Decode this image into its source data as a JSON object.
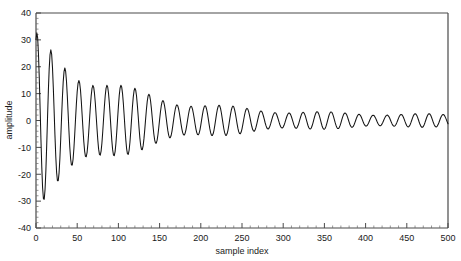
{
  "chart_data": {
    "type": "line",
    "title": "",
    "xlabel": "sample  index",
    "ylabel": "amplitude",
    "xlim": [
      0,
      500
    ],
    "ylim": [
      -40,
      40
    ],
    "grid": false,
    "legend": null,
    "line_color": "#141414",
    "background_color": "#ffffff",
    "axis_color": "#4a4a4a",
    "x_ticks": [
      0,
      50,
      100,
      150,
      200,
      250,
      300,
      350,
      400,
      450,
      500
    ],
    "x_tick_labels": [
      "0",
      "50",
      "100",
      "150",
      "200",
      "250",
      "300",
      "350",
      "400",
      "450",
      "500"
    ],
    "x_minor_step": 10,
    "y_ticks": [
      -40,
      -30,
      -20,
      -10,
      0,
      10,
      20,
      30,
      40
    ],
    "y_tick_labels": [
      "-40",
      "-30",
      "-20",
      "-10",
      "0",
      "10",
      "20",
      "30",
      "40"
    ],
    "y_minor_step": 2,
    "model": {
      "kind": "damped-beat-sinusoid",
      "period_samples": 17.0,
      "beat_period_samples": 118.0,
      "beat_depth": 0.3,
      "decay_constant_samples": 105.0,
      "floor_amplitude": 2.2,
      "initial_amplitude": 33.0,
      "phase_offset_rad": 1.15,
      "n_points": 501
    },
    "series": [
      {
        "name": "amplitude",
        "x": [
          0,
          5,
          10,
          15,
          20,
          25,
          30,
          35,
          40,
          45,
          50,
          60,
          70,
          80,
          90,
          100,
          120,
          140,
          160,
          180,
          200,
          250,
          300,
          350,
          400,
          450,
          500
        ],
        "y": [
          9,
          14,
          -26,
          32,
          -36,
          33,
          -30,
          21,
          -14,
          7,
          -6,
          17,
          -18,
          20,
          -19,
          15,
          14,
          13,
          12,
          10,
          9,
          6,
          5,
          4,
          3,
          3,
          2
        ]
      }
    ]
  }
}
